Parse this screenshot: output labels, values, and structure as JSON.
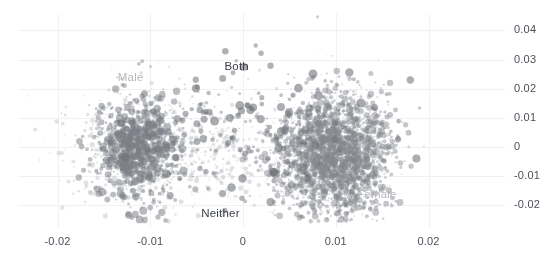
{
  "chart_data": {
    "type": "scatter",
    "title": "",
    "xlabel": "",
    "ylabel": "",
    "xlim": [
      -0.0255,
      0.0255
    ],
    "ylim": [
      -0.0255,
      0.0465
    ],
    "grid": true,
    "legend_position": "inline-annotations",
    "x_ticks": [
      "-0.02",
      "-0.01",
      "0",
      "0.01",
      "0.02"
    ],
    "x_tick_values": [
      -0.02,
      -0.01,
      0,
      0.01,
      0.02
    ],
    "y_ticks": [
      "0.04",
      "0.03",
      "0.02",
      "0.01",
      "0",
      "-0.01",
      "-0.02"
    ],
    "y_tick_values": [
      0.04,
      0.03,
      0.02,
      0.01,
      0,
      -0.01,
      -0.02
    ],
    "annotations": [
      {
        "text": "Male",
        "x": -0.0135,
        "y": 0.0235,
        "style": "light"
      },
      {
        "text": "Both",
        "x": -0.002,
        "y": 0.0275,
        "style": "dark"
      },
      {
        "text": "Neither",
        "x": -0.0045,
        "y": -0.023,
        "style": "dark"
      },
      {
        "text": "Female",
        "x": 0.0123,
        "y": -0.0165,
        "style": "light"
      }
    ],
    "series": [
      {
        "name": "Male",
        "color": "#7b7f86",
        "center": [
          -0.0113,
          -0.0005
        ],
        "spread": [
          0.0022,
          0.0085
        ],
        "n_points": 900,
        "point_size_range": [
          1.0,
          4.2
        ],
        "opacity": 0.55
      },
      {
        "name": "Female",
        "color": "#85888f",
        "center": [
          0.0098,
          -0.0025
        ],
        "spread": [
          0.0029,
          0.0098
        ],
        "n_points": 2600,
        "point_size_range": [
          0.8,
          3.4
        ],
        "opacity": 0.5
      },
      {
        "name": "Both",
        "color": "#6e7278",
        "center": [
          0.0015,
          0.0045
        ],
        "spread": [
          0.007,
          0.0125
        ],
        "n_points": 210,
        "point_size_range": [
          1.6,
          4.6
        ],
        "opacity": 0.6
      },
      {
        "name": "Neither",
        "color": "#b9bcc1",
        "center": [
          -0.007,
          -0.002
        ],
        "spread": [
          0.0065,
          0.0105
        ],
        "n_points": 700,
        "point_size_range": [
          0.7,
          2.6
        ],
        "opacity": 0.45
      }
    ],
    "colors": {
      "grid": "#f0f1f3",
      "tick_text": "#4a4f57",
      "background": "#ffffff",
      "label_light": "#b5b8bc",
      "label_dark": "#3b3f46"
    },
    "plot_area_px": {
      "left": 18,
      "right": 505,
      "top": 14,
      "bottom": 228
    }
  }
}
